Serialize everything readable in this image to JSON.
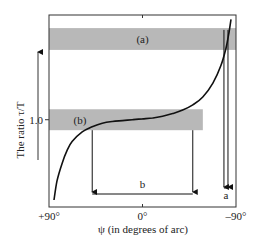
{
  "chart_data": {
    "type": "line",
    "title": "",
    "xlabel": "ψ (in degrees of arc)",
    "ylabel": "The ratio τ/T",
    "x_ticks": [
      {
        "value": 90,
        "label": "+90°"
      },
      {
        "value": 0,
        "label": "0°"
      },
      {
        "value": -90,
        "label": "–90°"
      }
    ],
    "y_ticks": [
      {
        "value": 1.0,
        "label": "1.0"
      }
    ],
    "xlim": [
      90,
      -90
    ],
    "ylim": [
      0,
      2.2
    ],
    "series": [
      {
        "name": "τ/T vs ψ",
        "color": "#111111",
        "points": [
          [
            88,
            0.08
          ],
          [
            85,
            0.3
          ],
          [
            80,
            0.5
          ],
          [
            75,
            0.65
          ],
          [
            70,
            0.75
          ],
          [
            60,
            0.86
          ],
          [
            50,
            0.92
          ],
          [
            40,
            0.96
          ],
          [
            30,
            0.98
          ],
          [
            20,
            0.99
          ],
          [
            10,
            1.0
          ],
          [
            0,
            1.01
          ],
          [
            -10,
            1.02
          ],
          [
            -20,
            1.04
          ],
          [
            -30,
            1.07
          ],
          [
            -40,
            1.11
          ],
          [
            -50,
            1.17
          ],
          [
            -60,
            1.26
          ],
          [
            -70,
            1.42
          ],
          [
            -78,
            1.62
          ],
          [
            -83,
            1.82
          ],
          [
            -86,
            2.0
          ],
          [
            -88,
            2.15
          ]
        ]
      }
    ],
    "bands": [
      {
        "label": "(a)",
        "y_range": [
          1.8,
          2.05
        ],
        "x_range": [
          90,
          -90
        ],
        "color": "#b8b8b8"
      },
      {
        "label": "(b)",
        "y_range": [
          0.88,
          1.12
        ],
        "x_range": [
          90,
          -60
        ],
        "color": "#b8b8b8"
      }
    ],
    "intervals": [
      {
        "label": "b",
        "x_range": [
          50,
          -50
        ]
      },
      {
        "label": "a",
        "x_range": [
          -81,
          -85
        ]
      }
    ],
    "axis_arrow": "up",
    "grid": false,
    "legend": "none"
  }
}
